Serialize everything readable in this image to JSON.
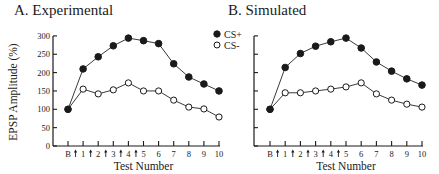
{
  "figure": {
    "panel_a_title": "A.  Experimental",
    "panel_b_title": "B.  Simulated",
    "ylabel": "EPSP Amplitude  (%)",
    "xlabel": "Test Number",
    "legend": [
      {
        "label": "CS+",
        "marker": "filled-circle"
      },
      {
        "label": "CS-",
        "marker": "open-circle"
      }
    ],
    "y_ticks": [
      0,
      50,
      100,
      150,
      200,
      250,
      300
    ],
    "x_ticks": [
      "B",
      "1",
      "2",
      "3",
      "4",
      "5",
      "6",
      "7",
      "8",
      "9",
      "10"
    ],
    "training_arrow_glyph": "↑",
    "training_arrows_after": [
      "B",
      "1",
      "2",
      "3",
      "4"
    ]
  },
  "chart_data": [
    {
      "type": "line",
      "title": "A.  Experimental",
      "xlabel": "Test Number",
      "ylabel": "EPSP Amplitude  (%)",
      "categories": [
        "B",
        "1",
        "2",
        "3",
        "4",
        "5",
        "6",
        "7",
        "8",
        "9",
        "10"
      ],
      "ylim": [
        0,
        300
      ],
      "grid": false,
      "legend_position": "top-right",
      "annotations": "Upward arrows between B–1, 1–2, 2–3, 3–4, 4–5 mark training trials",
      "series": [
        {
          "name": "CS+",
          "marker": "filled-circle",
          "values": [
            100,
            210,
            243,
            273,
            294,
            287,
            279,
            224,
            188,
            169,
            150
          ]
        },
        {
          "name": "CS-",
          "marker": "open-circle",
          "values": [
            100,
            155,
            142,
            153,
            172,
            150,
            150,
            125,
            106,
            101,
            79
          ]
        }
      ]
    },
    {
      "type": "line",
      "title": "B.  Simulated",
      "xlabel": "Test Number",
      "ylabel": "EPSP Amplitude  (%)",
      "categories": [
        "B",
        "1",
        "2",
        "3",
        "4",
        "5",
        "6",
        "7",
        "8",
        "9",
        "10"
      ],
      "ylim": [
        0,
        300
      ],
      "grid": false,
      "annotations": "Upward arrows between B–1, 1–2, 2–3, 3–4, 4–5 mark training trials",
      "series": [
        {
          "name": "CS+",
          "marker": "filled-circle",
          "values": [
            100,
            214,
            252,
            272,
            284,
            294,
            267,
            229,
            204,
            183,
            166
          ]
        },
        {
          "name": "CS-",
          "marker": "open-circle",
          "values": [
            100,
            145,
            145,
            150,
            155,
            161,
            172,
            142,
            125,
            114,
            106
          ]
        }
      ]
    }
  ]
}
